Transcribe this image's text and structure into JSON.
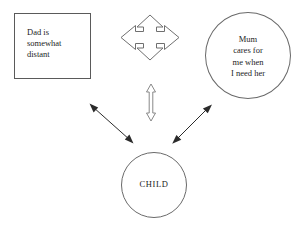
{
  "diagram": {
    "background_color": "#ffffff",
    "stroke_color": "#5a5a5a",
    "text_color": "#1c1c1c",
    "nodes": [
      {
        "id": "dad",
        "shape": "rectangle",
        "label": "Dad  is\nsomewhat\ndistant",
        "align": "left"
      },
      {
        "id": "mum",
        "shape": "circle",
        "label": "Mum\ncares for\nme when\nI need her",
        "align": "center"
      },
      {
        "id": "child",
        "shape": "circle",
        "label": "CHILD",
        "align": "center"
      }
    ],
    "connectors": [
      {
        "id": "dad-mum",
        "type": "four-way-arrow-outline",
        "from": "dad",
        "to": "mum",
        "heads": "both"
      },
      {
        "id": "parents-child",
        "type": "vertical-double-arrow-outline",
        "from": "parents",
        "to": "child",
        "heads": "both"
      },
      {
        "id": "dad-child",
        "type": "diagonal-double-arrow-solid",
        "from": "dad",
        "to": "child",
        "heads": "both"
      },
      {
        "id": "mum-child",
        "type": "diagonal-double-arrow-solid",
        "from": "mum",
        "to": "child",
        "heads": "both"
      }
    ]
  }
}
